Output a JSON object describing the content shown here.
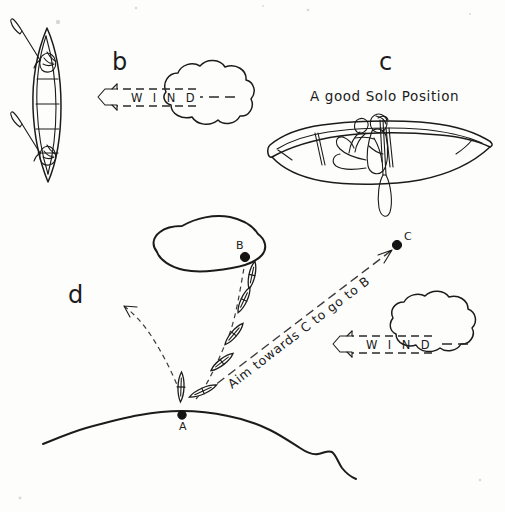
{
  "figure": {
    "background_color": "#fdfdfc",
    "ink_color": "#1b1b1b"
  },
  "panels": [
    {
      "id": "b",
      "label": "b",
      "label_position": {
        "x": 112,
        "y": 70
      },
      "description": "Top view of a tandem canoe broadside to the wind with two paddlers",
      "wind_label": "W I N D",
      "wind_direction": "right-to-left"
    },
    {
      "id": "c",
      "label": "c",
      "label_position": {
        "x": 379,
        "y": 70
      },
      "caption": "A good Solo Position",
      "caption_position": {
        "x": 388,
        "y": 100
      },
      "description": "Side view of a canoe with one paddler kneeling just aft of centre"
    },
    {
      "id": "d",
      "label": "d",
      "label_position": {
        "x": 75,
        "y": 295
      },
      "description": "Chart view showing a canoe ferrying from point A on the shore toward island point B by aiming at point C",
      "annotation": "Aim towards C to go to B",
      "wind_label": "W I N D",
      "wind_direction": "right-to-left",
      "points": [
        {
          "name": "A",
          "x": 182,
          "y": 415,
          "label_x": 185,
          "label_y": 428,
          "note": "start on shoreline"
        },
        {
          "name": "B",
          "x": 245,
          "y": 257,
          "label_x": 238,
          "label_y": 250,
          "note": "destination on island"
        },
        {
          "name": "C",
          "x": 397,
          "y": 246,
          "label_x": 404,
          "label_y": 240,
          "note": "aiming mark upwind"
        }
      ]
    }
  ],
  "wind_arrows": [
    {
      "id": "wind-top",
      "text": "W I N D",
      "text_x": 158,
      "text_y": 103
    },
    {
      "id": "wind-bottom",
      "text": "W I N D",
      "text_x": 408,
      "text_y": 350
    }
  ],
  "annotations": [
    {
      "id": "aim-label",
      "text": "Aim towards C to go to B"
    }
  ],
  "labels": {
    "panel_b": "b",
    "panel_c": "c",
    "panel_d": "d",
    "point_a": "A",
    "point_b": "B",
    "point_c": "C",
    "solo_caption": "A good Solo Position",
    "wind": "W I N D",
    "aim": "Aim towards C to go to B"
  }
}
